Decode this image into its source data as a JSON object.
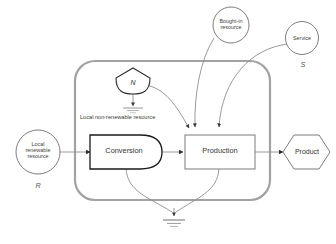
{
  "diagram": {
    "type": "energy-systems-flow",
    "colors": {
      "boundary": "#9a9a9a",
      "flow_line": "#8c8c8c",
      "shape_stroke": "#6e6e6e",
      "emphasis_stroke": "#1a1a1a",
      "text": "#3f3f3f",
      "background": "#ffffff"
    },
    "external_sources": [
      {
        "id": "local-renewable-resource",
        "shape": "circle",
        "label": "Local\nrenewable\nresource",
        "tag": "R",
        "position": "outside-left"
      },
      {
        "id": "bought-in-resource",
        "shape": "circle",
        "label": "Bought-in\nresource",
        "tag": "",
        "position": "outside-top"
      },
      {
        "id": "service",
        "shape": "circle",
        "label": "Service",
        "tag": "S",
        "position": "outside-top-right"
      }
    ],
    "internal_storage": [
      {
        "id": "local-non-renewable-resource",
        "shape": "source-pentagon",
        "symbol": "N",
        "caption": "Local non-renewable resource"
      }
    ],
    "processes": [
      {
        "id": "conversion",
        "shape": "bullet",
        "label": "Conversion"
      },
      {
        "id": "production",
        "shape": "rectangle",
        "label": "Production"
      }
    ],
    "outputs": [
      {
        "id": "product",
        "shape": "hexagon",
        "label": "Product"
      }
    ],
    "sinks": [
      {
        "id": "heat-sink-storage",
        "shape": "ground-heat-sink",
        "label": ""
      },
      {
        "id": "heat-sink-system",
        "shape": "ground-heat-sink",
        "label": ""
      }
    ],
    "flows": [
      {
        "from": "local-renewable-resource",
        "to": "conversion",
        "style": "straight-arrow"
      },
      {
        "from": "local-non-renewable-resource",
        "to": "heat-sink-storage",
        "style": "straight-arrow"
      },
      {
        "from": "local-non-renewable-resource",
        "to": "production",
        "style": "curve-arrow"
      },
      {
        "from": "bought-in-resource",
        "to": "production",
        "style": "curve-arrow"
      },
      {
        "from": "service",
        "to": "production",
        "style": "curve-arrow"
      },
      {
        "from": "conversion",
        "to": "production",
        "style": "straight-arrow"
      },
      {
        "from": "production",
        "to": "product",
        "style": "straight-arrow"
      },
      {
        "from": "conversion",
        "to": "heat-sink-system",
        "style": "curve-arrow"
      },
      {
        "from": "production",
        "to": "heat-sink-system",
        "style": "curve-arrow"
      }
    ],
    "system_boundary": {
      "id": "system-boundary",
      "shape": "rounded-rectangle",
      "label": ""
    }
  }
}
